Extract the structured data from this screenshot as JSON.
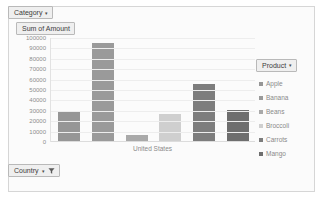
{
  "chart_data": {
    "type": "bar",
    "title": "Sum of Amount",
    "xlabel": "United States",
    "ylabel": "",
    "categories": [
      "Apple",
      "Banana",
      "Beans",
      "Broccoli",
      "Carrots",
      "Mango"
    ],
    "values": [
      29000,
      95000,
      7000,
      26500,
      56000,
      31000
    ],
    "ylim": [
      0,
      100000
    ],
    "yticks": [
      "100000",
      "90000",
      "80000",
      "70000",
      "60000",
      "50000",
      "40000",
      "30000",
      "20000",
      "10000",
      "0"
    ],
    "ytick_values": [
      100000,
      90000,
      80000,
      70000,
      60000,
      50000,
      40000,
      30000,
      20000,
      10000,
      0
    ],
    "x_categories": [
      "United States"
    ],
    "grid": true,
    "legend_position": "right",
    "series_colors": [
      "#969696",
      "#9a9a9a",
      "#a9a9a9",
      "#cfcfcf",
      "#7d7d7d",
      "#6e6e6e"
    ]
  },
  "field_buttons": {
    "category": {
      "label": "Category",
      "caret": "▾"
    },
    "value": {
      "label": "Sum of Amount",
      "caret": ""
    },
    "country": {
      "label": "Country",
      "caret": "▾",
      "filter_icon": "filter-funnel-icon"
    }
  },
  "legend": {
    "title": "Product",
    "caret": "▾",
    "items": [
      {
        "label": "Apple",
        "color": "#969696"
      },
      {
        "label": "Banana",
        "color": "#9a9a9a"
      },
      {
        "label": "Beans",
        "color": "#a9a9a9"
      },
      {
        "label": "Broccoli",
        "color": "#cfcfcf"
      },
      {
        "label": "Carrots",
        "color": "#7d7d7d"
      },
      {
        "label": "Mango",
        "color": "#6e6e6e"
      }
    ]
  }
}
